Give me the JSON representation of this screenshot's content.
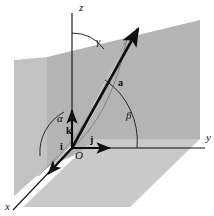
{
  "figure": {
    "background_color": "#ffffff",
    "line_color": "#111111",
    "width": 214,
    "height": 216
  },
  "axes": {
    "x_label": "x",
    "y_label": "y",
    "z_label": "z",
    "origin_label": "O"
  },
  "planes": [
    {
      "name": "yz-plane-backdrop",
      "fill": "#b4b4b4",
      "points": "47,57 200,20 200,139 112,139 47,167"
    },
    {
      "name": "xy-plane-floor",
      "fill": "#c9c9c9",
      "points": "23,207 94,139 200,139 130,207"
    },
    {
      "name": "xz-plane-left",
      "fill": "#c2c2c2",
      "points": "14,60 47,57 47,167 14,196"
    }
  ],
  "surfaces": [
    {
      "name": "spherical-triangle",
      "fill": "#ebe7dc",
      "description": "shaded curved sector between vector a and the coordinate axes"
    }
  ],
  "vectors": [
    {
      "name": "a",
      "label": "a",
      "label_x": 120,
      "label_y": 84,
      "bold": true
    },
    {
      "name": "i",
      "label": "i",
      "label_x": 62,
      "label_y": 149,
      "bold": true
    },
    {
      "name": "j",
      "label": "j",
      "label_x": 91,
      "label_y": 143,
      "bold": true
    },
    {
      "name": "k",
      "label": "k",
      "label_x": 68,
      "label_y": 133,
      "bold": true
    }
  ],
  "angles": [
    {
      "name": "alpha",
      "symbol": "α",
      "label_x": 60,
      "label_y": 121,
      "between": "a and x-axis"
    },
    {
      "name": "beta",
      "symbol": "β",
      "label_x": 128,
      "label_y": 118,
      "between": "a and y-axis"
    },
    {
      "name": "gamma",
      "symbol": "γ",
      "label_x": 97,
      "label_y": 44,
      "between": "a and z-axis"
    }
  ],
  "labels": {
    "x": {
      "text": "x",
      "x": 7,
      "y": 208
    },
    "y": {
      "text": "y",
      "x": 206,
      "y": 140
    },
    "z": {
      "text": "z",
      "x": 79,
      "y": 11
    },
    "origin": {
      "text": "O",
      "x": 76,
      "y": 157
    }
  }
}
